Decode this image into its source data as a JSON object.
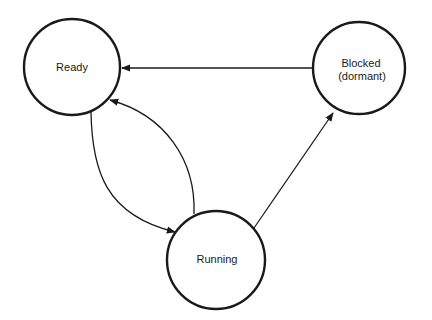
{
  "diagram": {
    "type": "state-transition",
    "states": [
      {
        "id": "ready",
        "lines": [
          "Ready"
        ],
        "cx": 72,
        "cy": 67,
        "r": 48
      },
      {
        "id": "blocked",
        "lines": [
          "Blocked",
          "(dormant)"
        ],
        "cx": 359,
        "cy": 68,
        "r": 46
      },
      {
        "id": "running",
        "lines": [
          "Running"
        ],
        "cx": 216,
        "cy": 260,
        "r": 49
      }
    ],
    "transitions": [
      {
        "from": "blocked",
        "to": "ready",
        "shape": "straight"
      },
      {
        "from": "ready",
        "to": "running",
        "shape": "curved"
      },
      {
        "from": "running",
        "to": "ready",
        "shape": "curved"
      },
      {
        "from": "running",
        "to": "blocked",
        "shape": "straight"
      }
    ],
    "colors": {
      "stroke": "#1a1a1a",
      "background": "#ffffff"
    }
  }
}
